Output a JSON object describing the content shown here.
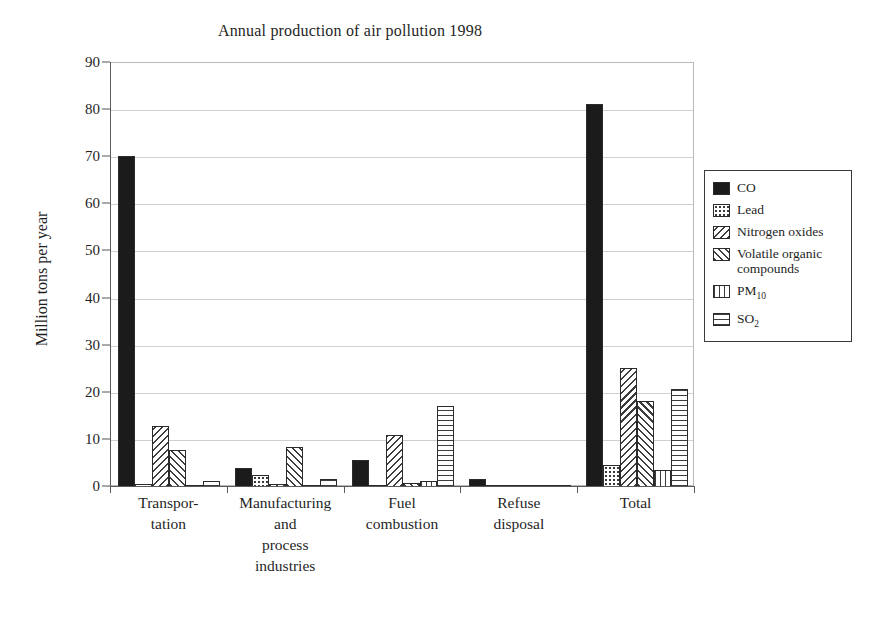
{
  "chart_data": {
    "type": "bar",
    "title": "Annual production of air pollution 1998",
    "xlabel": "",
    "ylabel": "Million tons per year",
    "ylim": [
      0,
      90
    ],
    "ytick_step": 10,
    "yticks": [
      "90",
      "80",
      "70",
      "60",
      "50",
      "40",
      "30",
      "20",
      "10",
      "0"
    ],
    "grid": true,
    "legend_position": "right",
    "categories": [
      "Transpor-\ntation",
      "Manufacturing\nand\nprocess\nindustries",
      "Fuel\ncombustion",
      "Refuse\ndisposal",
      "Total"
    ],
    "series": [
      {
        "name": "CO",
        "pattern": "solid-black",
        "values": [
          70.3,
          4.1,
          5.7,
          1.7,
          81.3
        ]
      },
      {
        "name": "Lead",
        "pattern": "dotted",
        "values": [
          0.6,
          2.5,
          0.5,
          0.4,
          4.7
        ]
      },
      {
        "name": "Nitrogen oxides",
        "pattern": "diagonal-hatch-back",
        "values": [
          13.0,
          0.6,
          11.0,
          0.3,
          25.3
        ]
      },
      {
        "name": "Volatile organic compounds",
        "pattern": "diagonal-hatch-fwd",
        "values": [
          7.8,
          8.5,
          0.8,
          0.5,
          18.2
        ]
      },
      {
        "name": "PM10",
        "pattern": "vertical-lines",
        "values": [
          0.5,
          0.5,
          1.3,
          0.3,
          3.6
        ]
      },
      {
        "name": "SO2",
        "pattern": "horizontal-lines",
        "values": [
          1.3,
          1.7,
          17.3,
          0.4,
          20.8
        ]
      }
    ]
  },
  "legend": {
    "items": [
      {
        "label": "CO",
        "label_sub": ""
      },
      {
        "label": "Lead",
        "label_sub": ""
      },
      {
        "label": "Nitrogen oxides",
        "label_sub": ""
      },
      {
        "label": "Volatile organic compounds",
        "label_sub": ""
      },
      {
        "label": "PM",
        "label_sub": "10"
      },
      {
        "label": "SO",
        "label_sub": "2"
      }
    ]
  },
  "colors": {
    "ink": "#1f1f1f",
    "bar_solid": "#1b1b1b",
    "grid": "#cfcfcf",
    "axis": "#5a5a5a",
    "plot_background": "#ffffff"
  }
}
